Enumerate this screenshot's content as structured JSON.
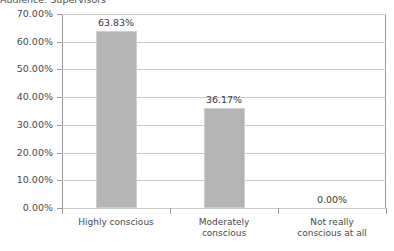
{
  "chart_data": {
    "type": "bar",
    "title": "Audience: Supervisors",
    "xlabel": "",
    "ylabel": "",
    "categories": [
      "Highly conscious",
      "Moderately conscious",
      "Not really conscious at all"
    ],
    "category_lines": [
      [
        "Highly conscious"
      ],
      [
        "Moderately",
        "conscious"
      ],
      [
        "Not really",
        "conscious at all"
      ]
    ],
    "values": [
      63.83,
      36.17,
      0.0
    ],
    "value_labels": [
      "63.83%",
      "36.17%",
      "0.00%"
    ],
    "ylim": [
      0,
      70
    ],
    "ytick_values": [
      0,
      10,
      20,
      30,
      40,
      50,
      60,
      70
    ],
    "ytick_labels": [
      "0.00%",
      "10.00%",
      "20.00%",
      "30.00%",
      "40.00%",
      "50.00%",
      "60.00%",
      "70.00%"
    ],
    "grid": true,
    "legend": false,
    "bar_color": "#b4b4b4",
    "bar_border_color": "#cfcfcf",
    "gridline_color": "#c9c9c9",
    "axis_color": "#9a9a9a",
    "background": "#ffffff"
  }
}
